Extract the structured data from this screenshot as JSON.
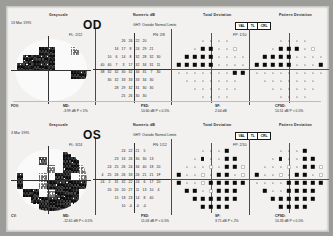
{
  "report": {
    "title": "Humphrey Visual Field Single Field Analysis",
    "column_headers": {
      "grayscale": "Grayscale",
      "numeric": "Numeric dB",
      "total_deviation": "Total Deviation",
      "pattern_deviation": "Pattern Deviation"
    },
    "ght_box_cells": [
      "VAL",
      "TL",
      "CRL"
    ]
  },
  "eyes": [
    {
      "eye_label": "OD",
      "test_date": "13 Mar 1995",
      "ght": "GHT:  Outside Normal Limits",
      "reliability": {
        "fixation_losses": "FL: 2/22",
        "false_negatives": "FN: 2/8",
        "false_positives": "FP: 1/10"
      },
      "numeric_db_rows": [
        [
          "",
          "",
          "",
          "26",
          "26",
          "22",
          "20",
          "",
          ""
        ],
        [
          "",
          "",
          "16",
          "17",
          "8",
          "24",
          "29",
          "21",
          ""
        ],
        [
          "",
          "10",
          "6",
          "14",
          "8",
          "32",
          "28",
          "32",
          "30"
        ],
        [
          "40",
          "40",
          "7",
          "3",
          "17",
          "32",
          "34",
          "31",
          "11"
        ],
        [
          "38",
          "32",
          "32",
          "30",
          "32",
          "34",
          "31",
          "7",
          "30"
        ],
        [
          "",
          "30",
          "32",
          "33",
          "33",
          "33",
          "34",
          "30",
          ""
        ],
        [
          "",
          "",
          "28",
          "29",
          "32",
          "31",
          "30",
          "30",
          ""
        ],
        [
          "",
          "",
          "",
          "25",
          "26",
          "30",
          "30",
          "",
          ""
        ]
      ],
      "stats": {
        "fov_label": "FOV:",
        "fov_value": "",
        "md_label": "MD:",
        "md_value": "-3.99 dB  P < 5%",
        "psd_label": "PSD:",
        "psd_value": "10.60 dB  P < 0.5%",
        "sf_label": "SF:",
        "sf_value": "2.04 dB",
        "cpsd_label": "CPSD:",
        "cpsd_value": "10.51 dB  P < 0.5%"
      },
      "total_deviation_grid": [
        [
          "",
          "",
          "",
          "d",
          "d",
          "d",
          "d",
          "",
          ""
        ],
        [
          "",
          "",
          "d",
          "b",
          "b",
          "d",
          "d",
          "p",
          ""
        ],
        [
          "",
          "b",
          "b",
          "b",
          "b",
          "d",
          "d",
          "d",
          "d"
        ],
        [
          "b",
          "b",
          "b",
          "b",
          "b",
          "d",
          "d",
          "d",
          "d"
        ],
        [
          "d",
          "d",
          "d",
          "d",
          "d",
          "d",
          "d",
          "b",
          "b"
        ],
        [
          "",
          "d",
          "d",
          "d",
          "d",
          "d",
          "d",
          "d",
          ""
        ],
        [
          "",
          "",
          "d",
          "d",
          "d",
          "d",
          "d",
          "d",
          ""
        ],
        [
          "",
          "",
          "",
          "d",
          "d",
          "d",
          "d",
          "",
          ""
        ]
      ],
      "pattern_deviation_grid": [
        [
          "",
          "",
          "",
          "d",
          "d",
          "d",
          "d",
          "",
          ""
        ],
        [
          "",
          "",
          "d",
          "b",
          "b",
          "b",
          "d",
          "p",
          ""
        ],
        [
          "",
          "b",
          "b",
          "b",
          "b",
          "d",
          "d",
          "d",
          "d"
        ],
        [
          "b",
          "b",
          "b",
          "b",
          "b",
          "d",
          "d",
          "d",
          "b"
        ],
        [
          "d",
          "d",
          "d",
          "d",
          "d",
          "d",
          "d",
          "d",
          "d"
        ],
        [
          "",
          "d",
          "d",
          "d",
          "d",
          "d",
          "d",
          "d",
          ""
        ],
        [
          "",
          "",
          "d",
          "d",
          "d",
          "d",
          "d",
          "d",
          ""
        ],
        [
          "",
          "",
          "",
          "d",
          "d",
          "d",
          "d",
          "",
          ""
        ]
      ]
    },
    {
      "eye_label": "OS",
      "test_date": "3 Mar 1995",
      "ght": "GHT:  Outside Normal Limits",
      "reliability": {
        "fixation_losses": "FL: 3/24",
        "false_negatives": "FN: 1/12",
        "false_positives": "FP: 2/10"
      },
      "numeric_db_rows": [
        [
          "",
          "",
          "",
          "24",
          "22",
          "21",
          "5",
          "",
          ""
        ],
        [
          "",
          "",
          "23",
          "16",
          "26",
          "30",
          "30",
          "13",
          ""
        ],
        [
          "",
          "24",
          "25",
          "26",
          "24",
          "34",
          "40",
          "18",
          "20"
        ],
        [
          "4",
          "25",
          "26",
          "26",
          "33",
          "26",
          "21",
          "21",
          "1F"
        ],
        [
          "24",
          "2",
          "31",
          "32",
          "22",
          "24",
          "6",
          "17",
          "20"
        ],
        [
          "",
          "20",
          "20",
          "20",
          "27",
          "11",
          "13",
          "10",
          "4"
        ],
        [
          "",
          "",
          "15",
          "18",
          "23",
          "14",
          "8",
          "40",
          ""
        ],
        [
          "",
          "",
          "",
          "10",
          "-0",
          "-0",
          "-0",
          "",
          ""
        ]
      ],
      "stats": {
        "fov_label": "CV:",
        "fov_value": "",
        "md_label": "MD:",
        "md_value": "-12.61 dB  P < 0.5%",
        "psd_label": "PSD:",
        "psd_value": "11.03 dB  P < 0.5%",
        "sf_label": "SF:",
        "sf_value": "3.71 dB  P < 2%",
        "cpsd_label": "CPSD:",
        "cpsd_value": "10.33 dB  P < 0.5%"
      },
      "total_deviation_grid": [
        [
          "",
          "",
          "",
          "d",
          "d",
          "d",
          "b",
          "",
          ""
        ],
        [
          "",
          "",
          "d",
          "h",
          "d",
          "d",
          "b",
          "b",
          ""
        ],
        [
          "",
          "d",
          "d",
          "d",
          "p",
          "d",
          "b",
          "b",
          "p"
        ],
        [
          "b",
          "d",
          "d",
          "p",
          "d",
          "b",
          "b",
          "d",
          "p"
        ],
        [
          "b",
          "d",
          "d",
          "p",
          "b",
          "b",
          "b",
          "b",
          "b"
        ],
        [
          "",
          "b",
          "b",
          "d",
          "p",
          "b",
          "b",
          "b",
          ""
        ],
        [
          "",
          "",
          "b",
          "b",
          "b",
          "b",
          "b",
          "b",
          ""
        ],
        [
          "",
          "",
          "",
          "b",
          "b",
          "b",
          "b",
          "",
          ""
        ]
      ],
      "pattern_deviation_grid": [
        [
          "",
          "",
          "",
          "d",
          "d",
          "d",
          "b",
          "",
          ""
        ],
        [
          "",
          "",
          "d",
          "h",
          "d",
          "d",
          "b",
          "b",
          ""
        ],
        [
          "",
          "d",
          "d",
          "d",
          "p",
          "d",
          "b",
          "b",
          "p"
        ],
        [
          "b",
          "d",
          "d",
          "p",
          "d",
          "b",
          "b",
          "d",
          "p"
        ],
        [
          "d",
          "d",
          "d",
          "d",
          "b",
          "b",
          "b",
          "b",
          "b"
        ],
        [
          "",
          "b",
          "d",
          "d",
          "b",
          "b",
          "b",
          "b",
          ""
        ],
        [
          "",
          "",
          "b",
          "b",
          "b",
          "b",
          "b",
          "b",
          ""
        ],
        [
          "",
          "",
          "",
          "b",
          "b",
          "b",
          "b",
          "",
          ""
        ]
      ]
    }
  ]
}
